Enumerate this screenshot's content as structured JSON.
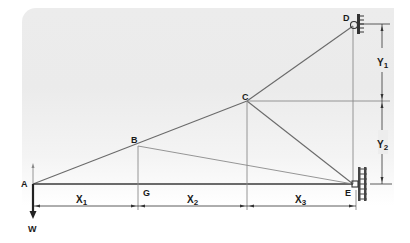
{
  "diagram": {
    "type": "truss / frame structure with wall supports",
    "nodes": {
      "A": {
        "label": "A"
      },
      "B": {
        "label": "B"
      },
      "C": {
        "label": "C"
      },
      "D": {
        "label": "D"
      },
      "E": {
        "label": "E"
      },
      "G": {
        "label": "G"
      }
    },
    "load": {
      "label": "W",
      "direction": "down",
      "at": "A"
    },
    "dimensions": {
      "x1": {
        "main": "X",
        "sub": "1"
      },
      "x2": {
        "main": "X",
        "sub": "2"
      },
      "x3": {
        "main": "X",
        "sub": "3"
      },
      "y1": {
        "main": "Y",
        "sub": "1"
      },
      "y2": {
        "main": "Y",
        "sub": "2"
      }
    },
    "members": [
      [
        "A",
        "B"
      ],
      [
        "B",
        "C"
      ],
      [
        "C",
        "D"
      ],
      [
        "A",
        "G"
      ],
      [
        "G",
        "E"
      ],
      [
        "B",
        "G"
      ],
      [
        "B",
        "E"
      ],
      [
        "C",
        "E"
      ],
      [
        "C",
        "vertical-to-AE"
      ],
      [
        "D",
        "E"
      ]
    ],
    "supports": [
      {
        "node": "D",
        "type": "wall pin"
      },
      {
        "node": "E",
        "type": "wall pin"
      }
    ],
    "colors": {
      "background": "#ebebeb",
      "member": "#6a6a6a",
      "beam": "#3a3a3a",
      "text": "#1a1a1a"
    }
  }
}
